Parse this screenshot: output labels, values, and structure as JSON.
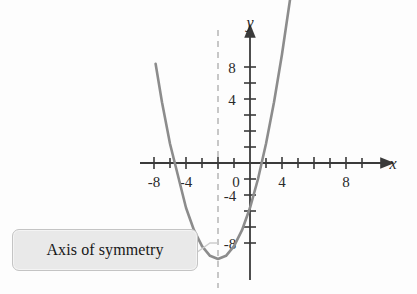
{
  "figure": {
    "background_color": "#fdfdfd",
    "curve_color": "#8c8c8c",
    "axis_color": "#3a3a3a",
    "dashed_line_color": "#b0b0b0",
    "leader_line_color": "#c9c9c9"
  },
  "axes": {
    "x_axis_label": "x",
    "y_axis_label": "y",
    "x_labels": [
      "-8",
      "-4",
      "0",
      "4",
      "8"
    ],
    "y_labels": [
      "8",
      "4",
      "-4",
      "-8"
    ],
    "x_label_values": [
      -8,
      -4,
      0,
      4,
      8
    ],
    "y_label_values": [
      8,
      4,
      -4,
      -8
    ],
    "x_tick_values": [
      -10,
      -8,
      -6,
      -4,
      -2,
      2,
      4,
      6,
      8,
      10
    ],
    "y_tick_values": [
      10,
      8,
      6,
      4,
      2,
      -2,
      -4,
      -6,
      -8
    ],
    "x_arrow": true,
    "y_arrow": true
  },
  "callout": {
    "label": "Axis of symmetry",
    "background_color": "#e9e9e9",
    "border_color": "#c4c4c4",
    "text_color": "#171717"
  },
  "chart_data": {
    "type": "line",
    "title": "",
    "xlabel": "x",
    "ylabel": "y",
    "xlim": [
      -11,
      11
    ],
    "ylim": [
      -10.5,
      10.5
    ],
    "grid": false,
    "legend": null,
    "series": [
      {
        "name": "parabola",
        "color": "#8c8c8c",
        "equation": "y = 0.8(x + 2)^2 - 6",
        "vertex": [
          -2,
          -6
        ],
        "x_intercepts": [
          -5.5,
          1.5
        ],
        "y_intercept": -2.8,
        "x": [
          -5.9,
          -5.5,
          -5.0,
          -4.5,
          -4.0,
          -3.5,
          -3.0,
          -2.5,
          -2.0,
          -1.5,
          -1.0,
          -0.5,
          0.0,
          0.5,
          1.0,
          1.5,
          2.0,
          2.5,
          2.9
        ],
        "values": [
          6.2,
          3.8,
          1.2,
          -0.8,
          -2.8,
          -4.2,
          -5.2,
          -5.8,
          -6.0,
          -5.8,
          -5.2,
          -4.2,
          -2.8,
          -1.0,
          1.2,
          3.8,
          6.8,
          10.2,
          12.5
        ]
      }
    ],
    "annotations": [
      {
        "name": "axis-of-symmetry",
        "label": "Axis of symmetry",
        "type": "vertical-dashed-line",
        "x": -2
      }
    ]
  }
}
